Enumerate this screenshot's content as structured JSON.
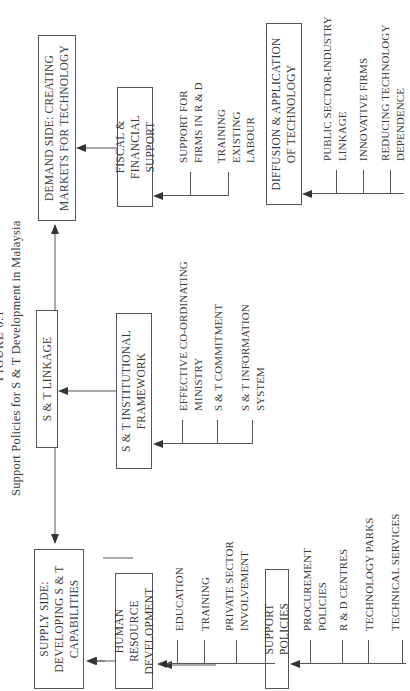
{
  "figure": {
    "label": "FIGURE 6.1",
    "caption": "Support Policies for S & T Development in Malaysia"
  },
  "top_row": {
    "supply": {
      "line1": "SUPPLY SIDE:",
      "line2": "DEVELOPING S & T",
      "line3": "CAPABILITIES"
    },
    "linkage": {
      "label": "S & T LINKAGE"
    },
    "demand": {
      "line1": "DEMAND SIDE: CREATING",
      "line2": "MARKETS FOR TECHNOLOGY"
    }
  },
  "columns": [
    {
      "box_line1": "HUMAN RESOURCE",
      "box_line2": "DEVELOPMENT",
      "items": [
        {
          "line1": "EDUCATION",
          "line2": ""
        },
        {
          "line1": "TRAINING",
          "line2": ""
        },
        {
          "line1": "PRIVATE SECTOR",
          "line2": "INVOLVEMENT"
        }
      ]
    },
    {
      "box_line1": "SUPPORT POLICIES",
      "box_line2": "",
      "items": [
        {
          "line1": "PROCUREMENT",
          "line2": "POLICIES"
        },
        {
          "line1": "R & D CENTRES",
          "line2": ""
        },
        {
          "line1": "TECHNOLOGY PARKS",
          "line2": ""
        },
        {
          "line1": "TECHNICAL SERVICES",
          "line2": ""
        }
      ]
    },
    {
      "box_line1": "S & T INSTITUTIONAL",
      "box_line2": "FRAMEWORK",
      "items": [
        {
          "line1": "EFFECTIVE CO-ORDINATING",
          "line2": "MINISTRY"
        },
        {
          "line1": "S & T COMMITMENT",
          "line2": ""
        },
        {
          "line1": "S & T INFORMATION",
          "line2": "SYSTEM"
        }
      ]
    },
    {
      "box_line1": "FISCAL & FINANCIAL",
      "box_line2": "SUPPORT",
      "items": [
        {
          "line1": "SUPPORT FOR",
          "line2": "FIRMS IN R & D"
        },
        {
          "line1": "TRAINING",
          "line2": "EXISTING",
          "line3": "LABOUR"
        }
      ]
    },
    {
      "box_line1": "DIFFUSION & APPLICATION",
      "box_line2": "OF TECHNOLOGY",
      "items": [
        {
          "line1": "PUBLIC SECTOR-INDUSTRY",
          "line2": "LINKAGE"
        },
        {
          "line1": "INNOVATIVE FIRMS",
          "line2": ""
        },
        {
          "line1": "REDUCING TECHNOLOGY",
          "line2": "DEPENDENCE"
        }
      ]
    }
  ],
  "colors": {
    "line": "#444444",
    "text": "#3a3a3a",
    "background": "#ffffff"
  }
}
